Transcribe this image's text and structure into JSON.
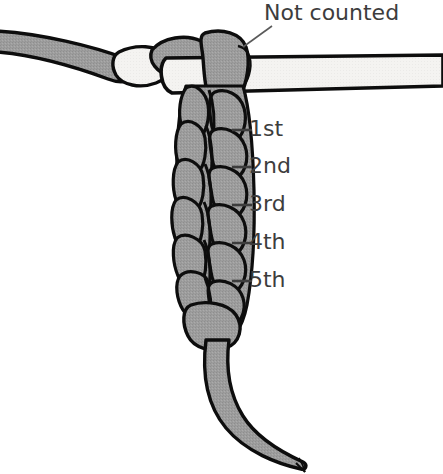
{
  "figure": {
    "background_color": "#ffffff",
    "yarn_fill": "#9a9a9a",
    "yarn_light_fill": "#f2f2f0",
    "outline_color": "#000000",
    "text_color": "#3d3d3d",
    "width": 443,
    "height": 474
  },
  "labels": {
    "not_counted": "Not counted",
    "stitch_1": "1st",
    "stitch_2": "2nd",
    "stitch_3": "3rd",
    "stitch_4": "4th",
    "stitch_5": "5th"
  },
  "annotation_ticks": [
    {
      "label": "1st",
      "y": 130
    },
    {
      "label": "2nd",
      "y": 167
    },
    {
      "label": "3rd",
      "y": 205
    },
    {
      "label": "4th",
      "y": 243
    },
    {
      "label": "5th",
      "y": 281
    }
  ],
  "parts": {
    "working_yarn": "working-yarn-strand",
    "hook_shaft": "crochet-hook-shaft",
    "slip_knot_loop": "slip-knot-loop",
    "chain_braid": "chain-stitch-braid",
    "yarn_tail": "yarn-tail-end",
    "leader_line": "not-counted-leader-line"
  }
}
